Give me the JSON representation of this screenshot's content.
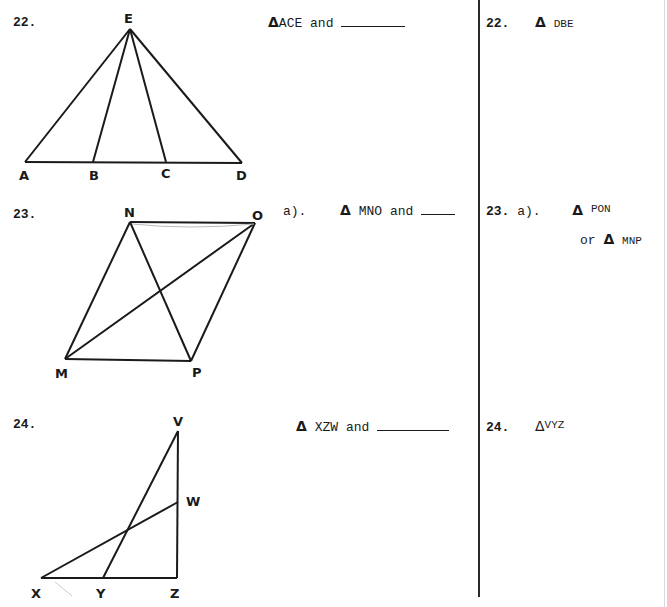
{
  "problems": [
    {
      "number": "22.",
      "question": {
        "prefix": "",
        "triangle": "ACE",
        "conjunction": "and"
      },
      "answer": {
        "number": "22.",
        "prefix": "",
        "triangle": "DBE"
      },
      "figure": {
        "labels": [
          "E",
          "A",
          "B",
          "C",
          "D"
        ]
      }
    },
    {
      "number": "23.",
      "question": {
        "prefix": "a).",
        "triangle": "MNO",
        "conjunction": "and"
      },
      "answer": {
        "number": "23.",
        "prefix": "a).",
        "triangle": "PON",
        "alt_conjunction": "or",
        "alt_triangle": "MNP"
      },
      "figure": {
        "labels": [
          "N",
          "O",
          "M",
          "P"
        ]
      }
    },
    {
      "number": "24.",
      "question": {
        "prefix": "",
        "triangle": "XZW",
        "conjunction": "and"
      },
      "answer": {
        "number": "24.",
        "prefix": "",
        "triangle": "VYZ"
      },
      "figure": {
        "labels": [
          "V",
          "W",
          "X",
          "Y",
          "Z"
        ]
      }
    }
  ],
  "symbols": {
    "triangle": "Δ"
  }
}
